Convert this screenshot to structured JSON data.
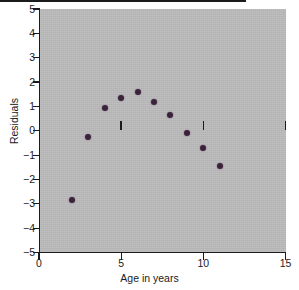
{
  "chart_data": {
    "type": "scatter",
    "title": "",
    "xlabel": "Age in years",
    "ylabel": "Residuals",
    "xlim": [
      0,
      15
    ],
    "ylim": [
      -5,
      5
    ],
    "grid": false,
    "legend": null,
    "x_ticks": [
      0,
      5,
      10,
      15
    ],
    "x_tick_labels": [
      "0",
      "5",
      "10",
      "15"
    ],
    "y_ticks": [
      5,
      4,
      3,
      2,
      1,
      0,
      -1,
      -2,
      -3,
      -4,
      -5
    ],
    "y_tick_labels": [
      "5",
      "4",
      "3",
      "2",
      "1",
      "0",
      "−1",
      "−2",
      "−3",
      "−4",
      "−5"
    ],
    "reference_line": {
      "y": 0,
      "style": "solid",
      "color": "#1b1b1b"
    },
    "marker_color": "#3a2338",
    "panel_color": "#b9b9b9",
    "points": [
      {
        "x": 2,
        "y": -2.85
      },
      {
        "x": 3,
        "y": -0.25
      },
      {
        "x": 4,
        "y": 0.92
      },
      {
        "x": 5,
        "y": 1.35
      },
      {
        "x": 6,
        "y": 1.6
      },
      {
        "x": 7,
        "y": 1.2
      },
      {
        "x": 8,
        "y": 0.65
      },
      {
        "x": 9,
        "y": -0.1
      },
      {
        "x": 10,
        "y": -0.7
      },
      {
        "x": 11,
        "y": -1.45
      }
    ],
    "x": [
      2,
      3,
      4,
      5,
      6,
      7,
      8,
      9,
      10,
      11
    ],
    "values": [
      -2.85,
      -0.25,
      0.92,
      1.35,
      1.6,
      1.2,
      0.65,
      -0.1,
      -0.7,
      -1.45
    ]
  }
}
